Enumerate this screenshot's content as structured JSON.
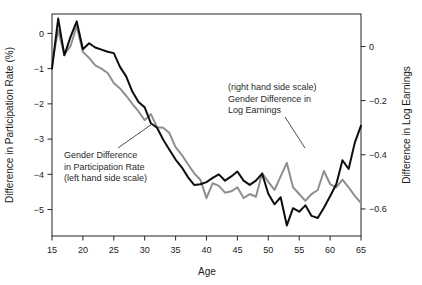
{
  "chart_data": {
    "type": "line",
    "title": "",
    "xlabel": "Age",
    "ylabel": "Difference in Participation Rate (%)",
    "ylabel_right": "Difference in Log Earnings",
    "grid": false,
    "legend_position": "inline-annotations",
    "xlim": [
      15,
      65
    ],
    "ylim": [
      -5.75,
      0.55
    ],
    "ylim_right": [
      -0.7,
      0.12
    ],
    "xticks": [
      15,
      20,
      25,
      30,
      35,
      40,
      45,
      50,
      55,
      60,
      65
    ],
    "xtick_labels": [
      "15",
      "20",
      "25",
      "30",
      "35",
      "40",
      "45",
      "50",
      "55",
      "60",
      "65"
    ],
    "yticks": [
      0,
      -1,
      -2,
      -3,
      -4,
      -5
    ],
    "ytick_labels": [
      "0",
      "-1",
      "-2",
      "-3",
      "-4",
      "-5"
    ],
    "yticks_right": [
      0,
      -0.2,
      -0.4,
      -0.6
    ],
    "ytick_labels_right": [
      "0",
      "-0.2",
      "-0.4",
      "-0.6"
    ],
    "x": [
      15,
      16,
      17,
      18,
      19,
      20,
      21,
      22,
      23,
      24,
      25,
      26,
      27,
      28,
      29,
      30,
      31,
      32,
      33,
      34,
      35,
      36,
      37,
      38,
      39,
      40,
      41,
      42,
      43,
      44,
      45,
      46,
      47,
      48,
      49,
      50,
      51,
      52,
      53,
      54,
      55,
      56,
      57,
      58,
      59,
      60,
      61,
      62,
      63,
      64,
      65
    ],
    "series": [
      {
        "name": "Gender Difference in Participation Rate",
        "axis": "left",
        "color": "#0d0d0d",
        "linewidth": 2.0,
        "values": [
          -1.0,
          0.42,
          -0.62,
          -0.1,
          0.34,
          -0.45,
          -0.28,
          -0.4,
          -0.46,
          -0.52,
          -0.56,
          -0.95,
          -1.22,
          -1.65,
          -1.95,
          -2.1,
          -2.55,
          -2.68,
          -3.02,
          -3.3,
          -3.58,
          -3.8,
          -4.08,
          -4.3,
          -4.28,
          -4.22,
          -4.1,
          -4.0,
          -4.18,
          -4.06,
          -3.92,
          -4.18,
          -4.3,
          -4.18,
          -3.98,
          -4.55,
          -4.85,
          -4.65,
          -5.45,
          -4.96,
          -5.06,
          -4.88,
          -5.18,
          -5.24,
          -4.95,
          -4.62,
          -4.28,
          -3.6,
          -3.85,
          -3.1,
          -2.62
        ]
      },
      {
        "name": "Gender Difference in Log Earnings",
        "axis": "right",
        "color": "#8f8f8f",
        "linewidth": 2.0,
        "values": [
          -0.065,
          0.06,
          -0.03,
          0.002,
          0.075,
          -0.02,
          -0.042,
          -0.07,
          -0.082,
          -0.098,
          -0.135,
          -0.155,
          -0.182,
          -0.212,
          -0.24,
          -0.272,
          -0.25,
          -0.298,
          -0.3,
          -0.32,
          -0.372,
          -0.4,
          -0.435,
          -0.468,
          -0.492,
          -0.56,
          -0.505,
          -0.515,
          -0.54,
          -0.535,
          -0.52,
          -0.56,
          -0.545,
          -0.555,
          -0.468,
          -0.5,
          -0.53,
          -0.48,
          -0.43,
          -0.52,
          -0.545,
          -0.57,
          -0.545,
          -0.53,
          -0.46,
          -0.508,
          -0.52,
          -0.492,
          -0.52,
          -0.552,
          -0.578
        ]
      }
    ],
    "annotations": [
      {
        "name": "participation-annotation",
        "lines": [
          "Gender Difference",
          "in Participation Rate",
          "(left hand side scale)"
        ],
        "text_x": 64,
        "text_y": 158,
        "leader": {
          "x1": 118,
          "y1": 148,
          "x2": 152,
          "y2": 124
        }
      },
      {
        "name": "earnings-annotation",
        "lines": [
          "(right hand side scale)",
          "Gender Difference in",
          "Log Earnings"
        ],
        "text_x": 228,
        "text_y": 90,
        "leader": {
          "x1": 285,
          "y1": 117,
          "x2": 305,
          "y2": 148
        }
      }
    ]
  },
  "figure": {
    "frame_color": "#222222",
    "background": "#ffffff"
  }
}
